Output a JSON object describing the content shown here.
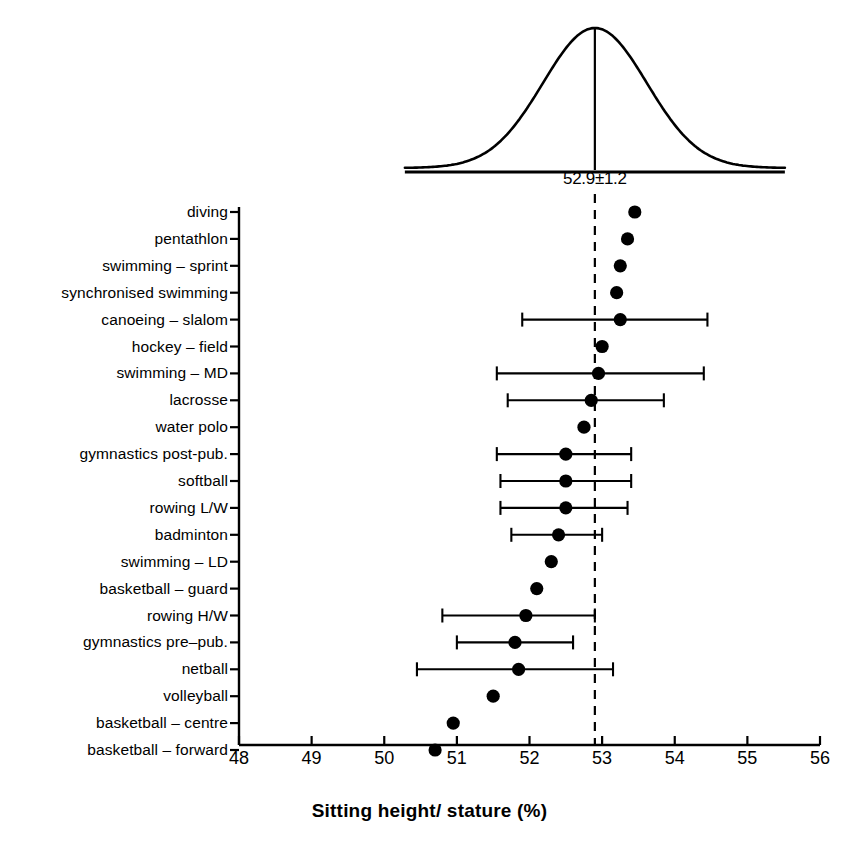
{
  "chart_data": {
    "type": "scatter",
    "title": "",
    "xlabel": "Sitting height/ stature (%)",
    "ylabel": "",
    "xlim": [
      48,
      56
    ],
    "xticks": [
      48,
      49,
      50,
      51,
      52,
      53,
      54,
      55,
      56
    ],
    "xticklabels": [
      "48",
      "49",
      "50",
      "51",
      "52",
      "53",
      "54",
      "55",
      "56"
    ],
    "grid": false,
    "legend": "none",
    "reference_line": {
      "value": 52.9,
      "style": "dashed",
      "label": "52.9±1.2"
    },
    "distribution_curve": {
      "shape": "normal",
      "mean": 52.9,
      "sd": 1.2,
      "label": "52.9±1.2"
    },
    "categories": [
      "diving",
      "pentathlon",
      "swimming – sprint",
      "synchronised swimming",
      "canoeing – slalom",
      "hockey – field",
      "swimming – MD",
      "lacrosse",
      "water polo",
      "gymnastics post-pub.",
      "softball",
      "rowing L/W",
      "badminton",
      "swimming – LD",
      "basketball – guard",
      "rowing H/W",
      "gymnastics pre–pub.",
      "netball",
      "volleyball",
      "basketball – centre",
      "basketball – forward"
    ],
    "values": [
      53.45,
      53.35,
      53.25,
      53.2,
      53.25,
      53.0,
      52.95,
      52.85,
      52.75,
      52.5,
      52.5,
      52.5,
      52.4,
      52.3,
      52.1,
      51.95,
      51.8,
      51.85,
      51.5,
      50.95,
      50.7
    ],
    "errors": [
      {
        "category": "diving",
        "value": 53.45,
        "low": null,
        "high": null
      },
      {
        "category": "pentathlon",
        "value": 53.35,
        "low": null,
        "high": null
      },
      {
        "category": "swimming – sprint",
        "value": 53.25,
        "low": null,
        "high": null
      },
      {
        "category": "synchronised swimming",
        "value": 53.2,
        "low": null,
        "high": null
      },
      {
        "category": "canoeing – slalom",
        "value": 53.25,
        "low": 51.9,
        "high": 54.45
      },
      {
        "category": "hockey – field",
        "value": 53.0,
        "low": null,
        "high": null
      },
      {
        "category": "swimming – MD",
        "value": 52.95,
        "low": 51.55,
        "high": 54.4
      },
      {
        "category": "lacrosse",
        "value": 52.85,
        "low": 51.7,
        "high": 53.85
      },
      {
        "category": "water polo",
        "value": 52.75,
        "low": null,
        "high": null
      },
      {
        "category": "gymnastics post-pub.",
        "value": 52.5,
        "low": 51.55,
        "high": 53.4
      },
      {
        "category": "softball",
        "value": 52.5,
        "low": 51.6,
        "high": 53.4
      },
      {
        "category": "rowing L/W",
        "value": 52.5,
        "low": 51.6,
        "high": 53.35
      },
      {
        "category": "badminton",
        "value": 52.4,
        "low": 51.75,
        "high": 53.0
      },
      {
        "category": "swimming – LD",
        "value": 52.3,
        "low": null,
        "high": null
      },
      {
        "category": "basketball – guard",
        "value": 52.1,
        "low": null,
        "high": null
      },
      {
        "category": "rowing H/W",
        "value": 51.95,
        "low": 50.8,
        "high": 52.9
      },
      {
        "category": "gymnastics pre–pub.",
        "value": 51.8,
        "low": 51.0,
        "high": 52.6
      },
      {
        "category": "netball",
        "value": 51.85,
        "low": 50.45,
        "high": 53.15
      },
      {
        "category": "volleyball",
        "value": 51.5,
        "low": null,
        "high": null
      },
      {
        "category": "basketball – centre",
        "value": 50.95,
        "low": null,
        "high": null
      },
      {
        "category": "basketball – forward",
        "value": 50.7,
        "low": null,
        "high": null
      }
    ]
  },
  "style": {
    "ink": "#000000",
    "background": "#ffffff"
  }
}
